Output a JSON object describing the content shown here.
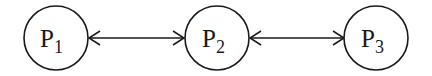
{
  "diagram": {
    "nodes": [
      {
        "id": "P1",
        "base": "P",
        "sub": "1",
        "cx": 56,
        "cy": 38,
        "r": 32
      },
      {
        "id": "P2",
        "base": "P",
        "sub": "2",
        "cx": 217,
        "cy": 38,
        "r": 32
      },
      {
        "id": "P3",
        "base": "P",
        "sub": "3",
        "cx": 376,
        "cy": 38,
        "r": 32
      }
    ],
    "edges": [
      {
        "from": "P1",
        "to": "P2",
        "type": "bidirectional"
      },
      {
        "from": "P2",
        "to": "P3",
        "type": "bidirectional"
      }
    ],
    "stroke_color": "#1a1a1a",
    "background": "#ffffff"
  }
}
